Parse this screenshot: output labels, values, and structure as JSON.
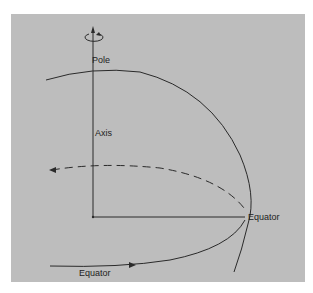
{
  "diagram": {
    "labels": {
      "pole": "Pole",
      "axis": "Axis",
      "equator_right": "Equator",
      "equator_bottom": "Equator"
    },
    "colors": {
      "background": "#bdbdbd",
      "line": "#2a2a2a",
      "page": "#ffffff"
    },
    "elements": [
      "rotation-arrow",
      "axis-line",
      "sphere-outline-arc",
      "equator-front-curve",
      "equator-back-dashed-curve",
      "radius-line"
    ]
  }
}
